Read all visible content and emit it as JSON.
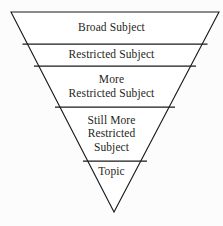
{
  "diagram": {
    "type": "inverted-triangle-funnel",
    "title": "",
    "shape": {
      "outline_color": "#1a1a1a",
      "fill_color": "#ffffff",
      "background_color": "#fcfcfc",
      "stroke_width": 1.1,
      "apex": {
        "x": 114,
        "y": 212
      },
      "top_left": {
        "x": 11,
        "y": 12
      },
      "top_right": {
        "x": 219,
        "y": 12
      }
    },
    "divider_y": [
      44,
      66,
      107,
      161
    ],
    "bands": [
      {
        "id": "band-broad-subject",
        "lines": [
          "Broad Subject"
        ],
        "top": 12,
        "bottom": 44
      },
      {
        "id": "band-restricted-subject",
        "lines": [
          "Restricted Subject"
        ],
        "top": 44,
        "bottom": 66
      },
      {
        "id": "band-more-restricted-subject",
        "lines": [
          "More",
          "Restricted Subject"
        ],
        "top": 66,
        "bottom": 107
      },
      {
        "id": "band-still-more-restricted-subject",
        "lines": [
          "Still More",
          "Restricted",
          "Subject"
        ],
        "top": 107,
        "bottom": 161
      },
      {
        "id": "band-topic",
        "lines": [
          "Topic"
        ],
        "top": 161,
        "bottom": 212
      }
    ]
  }
}
